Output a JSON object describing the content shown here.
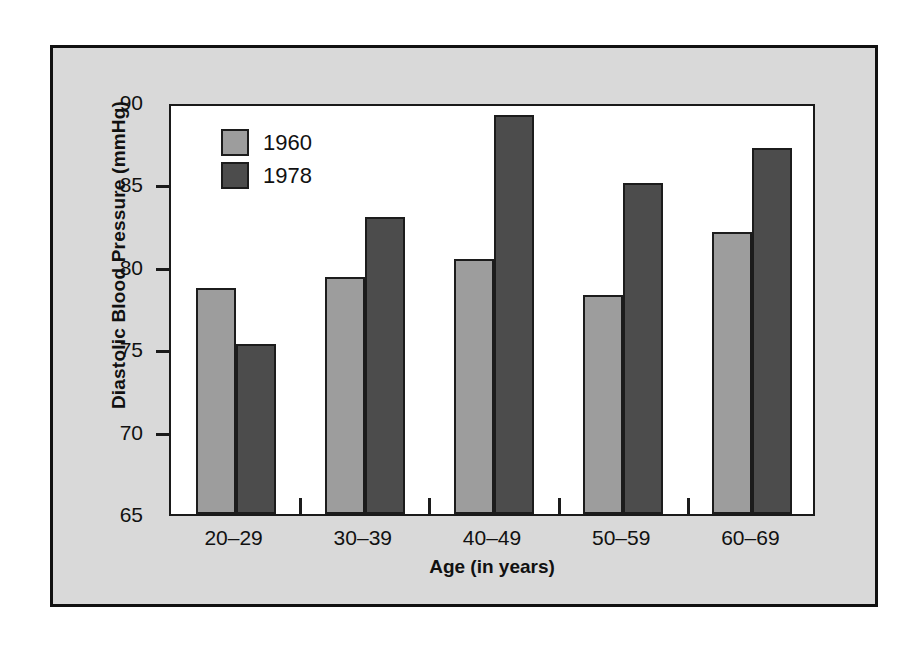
{
  "chart_data": {
    "type": "bar",
    "title": "",
    "subtitle": "",
    "xlabel": "Age (in years)",
    "ylabel": "Diastolic Blood Pressure (mmHg)",
    "categories": [
      "20–29",
      "30–39",
      "40–49",
      "50–59",
      "60–69"
    ],
    "series": [
      {
        "name": "1960",
        "color": "#9d9d9d",
        "values": [
          78.7,
          79.4,
          80.5,
          78.3,
          82.1
        ]
      },
      {
        "name": "1978",
        "color": "#4c4c4c",
        "values": [
          75.3,
          83.0,
          89.2,
          85.1,
          87.2
        ]
      }
    ],
    "ylim": [
      65,
      90
    ],
    "yticks": [
      65,
      70,
      75,
      80,
      85,
      90
    ],
    "ytick_labels": [
      "65",
      "70",
      "75",
      "80",
      "85",
      "90"
    ],
    "grid": false,
    "legend_position": "top-left inside plot area"
  },
  "colors": {
    "page_background": "#ffffff",
    "panel_background": "#d9d9d9",
    "plot_background": "#ffffff",
    "frame_border": "#111111",
    "axis": "#1a1a1a",
    "text": "#111111",
    "series_1960": "#9d9d9d",
    "series_1978": "#4c4c4c"
  }
}
